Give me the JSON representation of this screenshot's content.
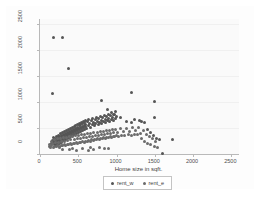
{
  "chart_data": {
    "type": "scatter",
    "title": "",
    "xlabel": "Home size in sqft.",
    "ylabel": "",
    "xlim": [
      0,
      2600
    ],
    "ylim": [
      0,
      2600
    ],
    "xticks": [
      "0",
      "500",
      "1000",
      "1500",
      "2000",
      "2500"
    ],
    "xtick_values": [
      0,
      500,
      1000,
      1500,
      2000,
      2500
    ],
    "yticks": [
      "0",
      "500",
      "1000",
      "1500",
      "2000",
      "2500"
    ],
    "ytick_values": [
      0,
      500,
      1000,
      1500,
      2000,
      2500
    ],
    "grid": true,
    "legend_position": "bottom",
    "series": [
      {
        "name": "rent_w",
        "color": "#555555",
        "marker": "circle",
        "points": [
          [
            180,
            2240
          ],
          [
            300,
            2240
          ],
          [
            370,
            1650
          ],
          [
            165,
            1160
          ],
          [
            800,
            1040
          ],
          [
            1200,
            1190
          ],
          [
            1500,
            1020
          ],
          [
            1490,
            710
          ],
          [
            880,
            860
          ],
          [
            960,
            760
          ],
          [
            1050,
            700
          ],
          [
            1130,
            620
          ],
          [
            1190,
            600
          ],
          [
            1230,
            660
          ],
          [
            1300,
            640
          ],
          [
            1330,
            620
          ],
          [
            1360,
            600
          ],
          [
            1410,
            470
          ],
          [
            1450,
            420
          ],
          [
            1480,
            350
          ],
          [
            1520,
            300
          ],
          [
            1560,
            270
          ],
          [
            1730,
            270
          ],
          [
            1600,
            10
          ],
          [
            150,
            200
          ],
          [
            160,
            260
          ],
          [
            170,
            230
          ],
          [
            175,
            310
          ],
          [
            185,
            180
          ],
          [
            190,
            260
          ],
          [
            195,
            300
          ],
          [
            200,
            170
          ],
          [
            205,
            240
          ],
          [
            210,
            290
          ],
          [
            215,
            200
          ],
          [
            220,
            330
          ],
          [
            225,
            260
          ],
          [
            230,
            190
          ],
          [
            235,
            310
          ],
          [
            240,
            240
          ],
          [
            245,
            350
          ],
          [
            250,
            280
          ],
          [
            255,
            210
          ],
          [
            260,
            330
          ],
          [
            265,
            260
          ],
          [
            270,
            390
          ],
          [
            275,
            300
          ],
          [
            280,
            230
          ],
          [
            285,
            350
          ],
          [
            290,
            290
          ],
          [
            295,
            420
          ],
          [
            300,
            330
          ],
          [
            305,
            260
          ],
          [
            310,
            380
          ],
          [
            315,
            310
          ],
          [
            320,
            440
          ],
          [
            325,
            350
          ],
          [
            330,
            280
          ],
          [
            335,
            400
          ],
          [
            340,
            330
          ],
          [
            345,
            460
          ],
          [
            350,
            370
          ],
          [
            355,
            300
          ],
          [
            360,
            420
          ],
          [
            365,
            350
          ],
          [
            370,
            470
          ],
          [
            375,
            390
          ],
          [
            380,
            320
          ],
          [
            385,
            440
          ],
          [
            390,
            370
          ],
          [
            395,
            490
          ],
          [
            400,
            410
          ],
          [
            405,
            340
          ],
          [
            410,
            460
          ],
          [
            415,
            390
          ],
          [
            420,
            510
          ],
          [
            425,
            430
          ],
          [
            430,
            360
          ],
          [
            435,
            480
          ],
          [
            440,
            410
          ],
          [
            445,
            530
          ],
          [
            450,
            450
          ],
          [
            455,
            380
          ],
          [
            460,
            500
          ],
          [
            465,
            430
          ],
          [
            470,
            550
          ],
          [
            475,
            470
          ],
          [
            480,
            400
          ],
          [
            485,
            520
          ],
          [
            490,
            450
          ],
          [
            495,
            570
          ],
          [
            500,
            490
          ],
          [
            505,
            420
          ],
          [
            510,
            540
          ],
          [
            515,
            470
          ],
          [
            520,
            590
          ],
          [
            525,
            510
          ],
          [
            530,
            440
          ],
          [
            535,
            560
          ],
          [
            540,
            490
          ],
          [
            545,
            610
          ],
          [
            550,
            530
          ],
          [
            555,
            460
          ],
          [
            560,
            580
          ],
          [
            565,
            510
          ],
          [
            570,
            630
          ],
          [
            575,
            550
          ],
          [
            580,
            480
          ],
          [
            585,
            600
          ],
          [
            590,
            530
          ],
          [
            595,
            650
          ],
          [
            600,
            570
          ],
          [
            610,
            500
          ],
          [
            620,
            620
          ],
          [
            630,
            550
          ],
          [
            640,
            670
          ],
          [
            650,
            590
          ],
          [
            660,
            520
          ],
          [
            670,
            640
          ],
          [
            680,
            570
          ],
          [
            690,
            690
          ],
          [
            700,
            610
          ],
          [
            710,
            540
          ],
          [
            720,
            660
          ],
          [
            730,
            590
          ],
          [
            740,
            710
          ],
          [
            750,
            630
          ],
          [
            760,
            560
          ],
          [
            770,
            680
          ],
          [
            780,
            610
          ],
          [
            790,
            730
          ],
          [
            800,
            650
          ],
          [
            810,
            580
          ],
          [
            820,
            700
          ],
          [
            830,
            630
          ],
          [
            840,
            750
          ],
          [
            850,
            670
          ],
          [
            860,
            600
          ],
          [
            870,
            720
          ],
          [
            880,
            650
          ],
          [
            890,
            770
          ],
          [
            900,
            690
          ],
          [
            910,
            620
          ],
          [
            920,
            740
          ],
          [
            930,
            670
          ],
          [
            940,
            790
          ],
          [
            950,
            710
          ],
          [
            960,
            640
          ],
          [
            970,
            760
          ],
          [
            980,
            690
          ],
          [
            990,
            810
          ],
          [
            1000,
            730
          ]
        ]
      },
      {
        "name": "rent_e",
        "color": "#6b6b6b",
        "marker": "circle",
        "points": [
          [
            120,
            140
          ],
          [
            130,
            190
          ],
          [
            140,
            120
          ],
          [
            145,
            240
          ],
          [
            155,
            160
          ],
          [
            165,
            210
          ],
          [
            175,
            130
          ],
          [
            185,
            280
          ],
          [
            195,
            150
          ],
          [
            205,
            220
          ],
          [
            215,
            140
          ],
          [
            225,
            290
          ],
          [
            235,
            160
          ],
          [
            245,
            230
          ],
          [
            255,
            150
          ],
          [
            265,
            300
          ],
          [
            275,
            170
          ],
          [
            285,
            240
          ],
          [
            295,
            160
          ],
          [
            305,
            310
          ],
          [
            315,
            180
          ],
          [
            325,
            250
          ],
          [
            335,
            170
          ],
          [
            345,
            320
          ],
          [
            355,
            190
          ],
          [
            365,
            260
          ],
          [
            375,
            180
          ],
          [
            385,
            330
          ],
          [
            395,
            200
          ],
          [
            405,
            270
          ],
          [
            415,
            190
          ],
          [
            425,
            340
          ],
          [
            435,
            210
          ],
          [
            445,
            280
          ],
          [
            455,
            200
          ],
          [
            465,
            350
          ],
          [
            475,
            220
          ],
          [
            485,
            290
          ],
          [
            495,
            210
          ],
          [
            505,
            360
          ],
          [
            515,
            230
          ],
          [
            525,
            300
          ],
          [
            535,
            220
          ],
          [
            545,
            370
          ],
          [
            555,
            240
          ],
          [
            565,
            310
          ],
          [
            575,
            230
          ],
          [
            585,
            380
          ],
          [
            595,
            250
          ],
          [
            605,
            320
          ],
          [
            615,
            240
          ],
          [
            625,
            390
          ],
          [
            635,
            260
          ],
          [
            645,
            330
          ],
          [
            655,
            250
          ],
          [
            665,
            400
          ],
          [
            675,
            270
          ],
          [
            685,
            340
          ],
          [
            695,
            260
          ],
          [
            705,
            410
          ],
          [
            715,
            280
          ],
          [
            725,
            350
          ],
          [
            735,
            270
          ],
          [
            745,
            420
          ],
          [
            755,
            290
          ],
          [
            765,
            360
          ],
          [
            775,
            280
          ],
          [
            785,
            430
          ],
          [
            795,
            300
          ],
          [
            805,
            370
          ],
          [
            815,
            290
          ],
          [
            825,
            440
          ],
          [
            835,
            310
          ],
          [
            845,
            380
          ],
          [
            855,
            300
          ],
          [
            865,
            450
          ],
          [
            875,
            320
          ],
          [
            885,
            390
          ],
          [
            895,
            310
          ],
          [
            905,
            460
          ],
          [
            915,
            330
          ],
          [
            925,
            400
          ],
          [
            935,
            320
          ],
          [
            945,
            470
          ],
          [
            955,
            340
          ],
          [
            965,
            410
          ],
          [
            975,
            330
          ],
          [
            985,
            480
          ],
          [
            995,
            350
          ],
          [
            1010,
            420
          ],
          [
            1030,
            340
          ],
          [
            1050,
            490
          ],
          [
            1070,
            360
          ],
          [
            1090,
            430
          ],
          [
            1110,
            350
          ],
          [
            1130,
            500
          ],
          [
            1150,
            370
          ],
          [
            1170,
            440
          ],
          [
            1190,
            360
          ],
          [
            1210,
            510
          ],
          [
            1230,
            380
          ],
          [
            1250,
            450
          ],
          [
            1270,
            370
          ],
          [
            1290,
            520
          ],
          [
            1310,
            390
          ],
          [
            1330,
            300
          ],
          [
            1350,
            460
          ],
          [
            1370,
            250
          ],
          [
            1390,
            380
          ],
          [
            1410,
            200
          ],
          [
            1430,
            330
          ],
          [
            1450,
            180
          ],
          [
            1470,
            290
          ],
          [
            1490,
            150
          ],
          [
            1510,
            240
          ],
          [
            1530,
            120
          ],
          [
            420,
            110
          ],
          [
            560,
            100
          ],
          [
            700,
            90
          ],
          [
            840,
            110
          ],
          [
            300,
            90
          ],
          [
            640,
            60
          ],
          [
            780,
            130
          ],
          [
            900,
            100
          ],
          [
            480,
            70
          ],
          [
            660,
            120
          ],
          [
            260,
            120
          ],
          [
            380,
            80
          ]
        ]
      }
    ]
  }
}
